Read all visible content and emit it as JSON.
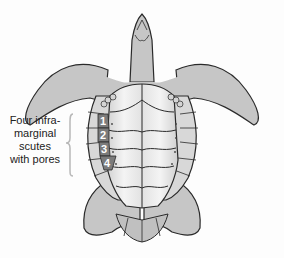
{
  "diagram": {
    "callout": {
      "lines": [
        "Four infra-",
        "marginal",
        "scutes",
        "with pores"
      ]
    },
    "scute_numbers": [
      "1",
      "2",
      "3",
      "4"
    ],
    "colors": {
      "body_fill": "#c6c6c6",
      "outline": "#2a2a2a",
      "plastron_light": "#f2f2f2",
      "scute_highlight": "#7b7b7b",
      "bracket": "#b8b8b8",
      "text": "#222222"
    }
  }
}
